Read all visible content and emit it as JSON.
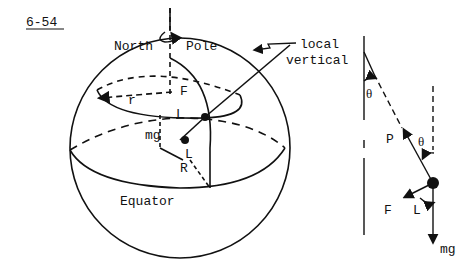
{
  "figure": {
    "number": "6-54",
    "labels": {
      "north": "North",
      "pole": "Pole",
      "local_vertical_1": "local",
      "local_vertical_2": "vertical",
      "r": "r",
      "F": "F",
      "L": "L",
      "mg": "mg",
      "R": "R",
      "equator": "Equator",
      "theta": "θ",
      "P": "P"
    },
    "colors": {
      "ink": "#111111",
      "background": "#ffffff"
    }
  }
}
